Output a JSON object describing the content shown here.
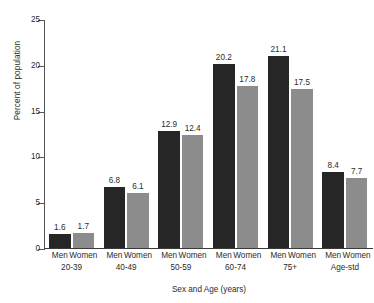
{
  "chart_data": {
    "type": "bar",
    "title": "",
    "xlabel": "Sex and Age (years)",
    "ylabel": "Percent of population",
    "ylim": [
      0,
      25
    ],
    "yticks": [
      0,
      5,
      10,
      15,
      20,
      25
    ],
    "ytick_labels": [
      "0",
      "5",
      "10",
      "15",
      "20",
      "25"
    ],
    "grid": false,
    "legend": "none",
    "categories": [
      "20-39",
      "40-49",
      "50-59",
      "60-74",
      "75+",
      "Age-std"
    ],
    "series": [
      {
        "name": "Men",
        "color": "#262626",
        "values": [
          1.6,
          6.8,
          12.9,
          20.2,
          21.1,
          8.4
        ],
        "labels": [
          "1.6",
          "6.8",
          "12.9",
          "20.2",
          "21.1",
          "8.4"
        ]
      },
      {
        "name": "Women",
        "color": "#8c8c8c",
        "values": [
          1.7,
          6.1,
          12.4,
          17.8,
          17.5,
          7.7
        ],
        "labels": [
          "1.7",
          "6.1",
          "12.4",
          "17.8",
          "17.5",
          "7.7"
        ]
      }
    ],
    "bar_labels": [
      "Men",
      "Women",
      "Men",
      "Women",
      "Men",
      "Women",
      "Men",
      "Women",
      "Men",
      "Women",
      "Men",
      "Women"
    ]
  }
}
